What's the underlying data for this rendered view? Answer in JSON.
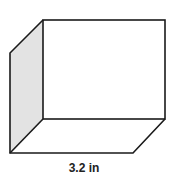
{
  "diagram": {
    "type": "rectangular-prism",
    "colors": {
      "stroke": "#1a1a1a",
      "side_face": "#e3e3e3",
      "face": "#ffffff"
    },
    "labels": {
      "bottom_edge": "3.2 in"
    }
  }
}
